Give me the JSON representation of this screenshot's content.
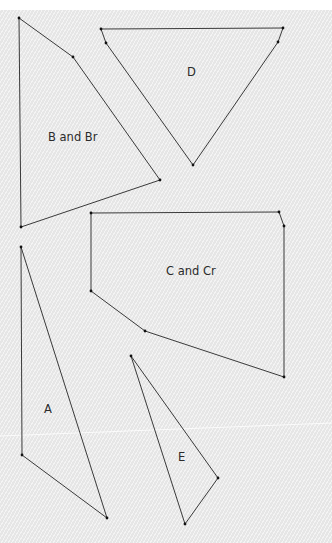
{
  "colors": {
    "background": "#e6e6e6",
    "line": "#3a3a3a",
    "vertex": "#111111",
    "label": "#2b2b2b",
    "page": "#ffffff"
  },
  "pieces": [
    {
      "id": "B",
      "label": "B and Br",
      "label_pos": [
        48,
        141
      ],
      "points": [
        [
          19,
          18
        ],
        [
          73,
          57
        ],
        [
          160,
          180
        ],
        [
          21,
          227
        ]
      ]
    },
    {
      "id": "D",
      "label": "D",
      "label_pos": [
        187,
        76
      ],
      "points": [
        [
          101,
          29
        ],
        [
          283,
          28
        ],
        [
          278,
          42
        ],
        [
          193,
          165
        ],
        [
          106,
          43
        ]
      ]
    },
    {
      "id": "C",
      "label": "C and Cr",
      "label_pos": [
        166,
        275
      ],
      "points": [
        [
          91,
          213
        ],
        [
          279,
          212
        ],
        [
          284,
          226
        ],
        [
          284,
          377
        ],
        [
          145,
          331
        ],
        [
          91,
          291
        ]
      ]
    },
    {
      "id": "A",
      "label": "A",
      "label_pos": [
        44,
        413
      ],
      "points": [
        [
          21,
          247
        ],
        [
          107,
          518
        ],
        [
          22,
          455
        ]
      ]
    },
    {
      "id": "E",
      "label": "E",
      "label_pos": [
        178,
        461
      ],
      "points": [
        [
          131,
          356
        ],
        [
          218,
          478
        ],
        [
          185,
          524
        ]
      ]
    }
  ]
}
